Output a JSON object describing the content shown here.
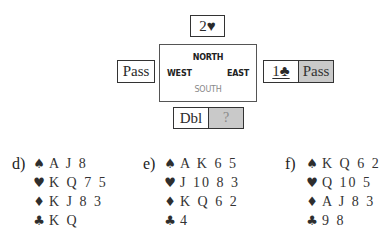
{
  "auction": {
    "north": {
      "bid": "2♥"
    },
    "west": {
      "bid": "Pass"
    },
    "east": {
      "bids": [
        "1♣",
        "Pass"
      ],
      "alerted_first": true
    },
    "south": {
      "bids": [
        "Dbl",
        "?"
      ]
    }
  },
  "compass": {
    "north": "NORTH",
    "west": "WEST",
    "east": "EAST",
    "south": "SOUTH"
  },
  "suits": {
    "spades": "♠",
    "hearts": "♥",
    "diamonds": "♦",
    "clubs": "♣"
  },
  "hands": [
    {
      "label": "d)",
      "spades": "A J 8",
      "hearts": "K Q 7 5",
      "diamonds": "K J 8 3",
      "clubs": "K Q"
    },
    {
      "label": "e)",
      "spades": "A K 6 5",
      "hearts": "J 10 8 3",
      "diamonds": "K Q 6 2",
      "clubs": "4"
    },
    {
      "label": "f)",
      "spades": "K Q 6 2",
      "hearts": "Q 10 5",
      "diamonds": "A J 8 3",
      "clubs": "9 8"
    }
  ],
  "colors": {
    "highlight_gray": "#c9c9c9",
    "border": "#333333"
  }
}
